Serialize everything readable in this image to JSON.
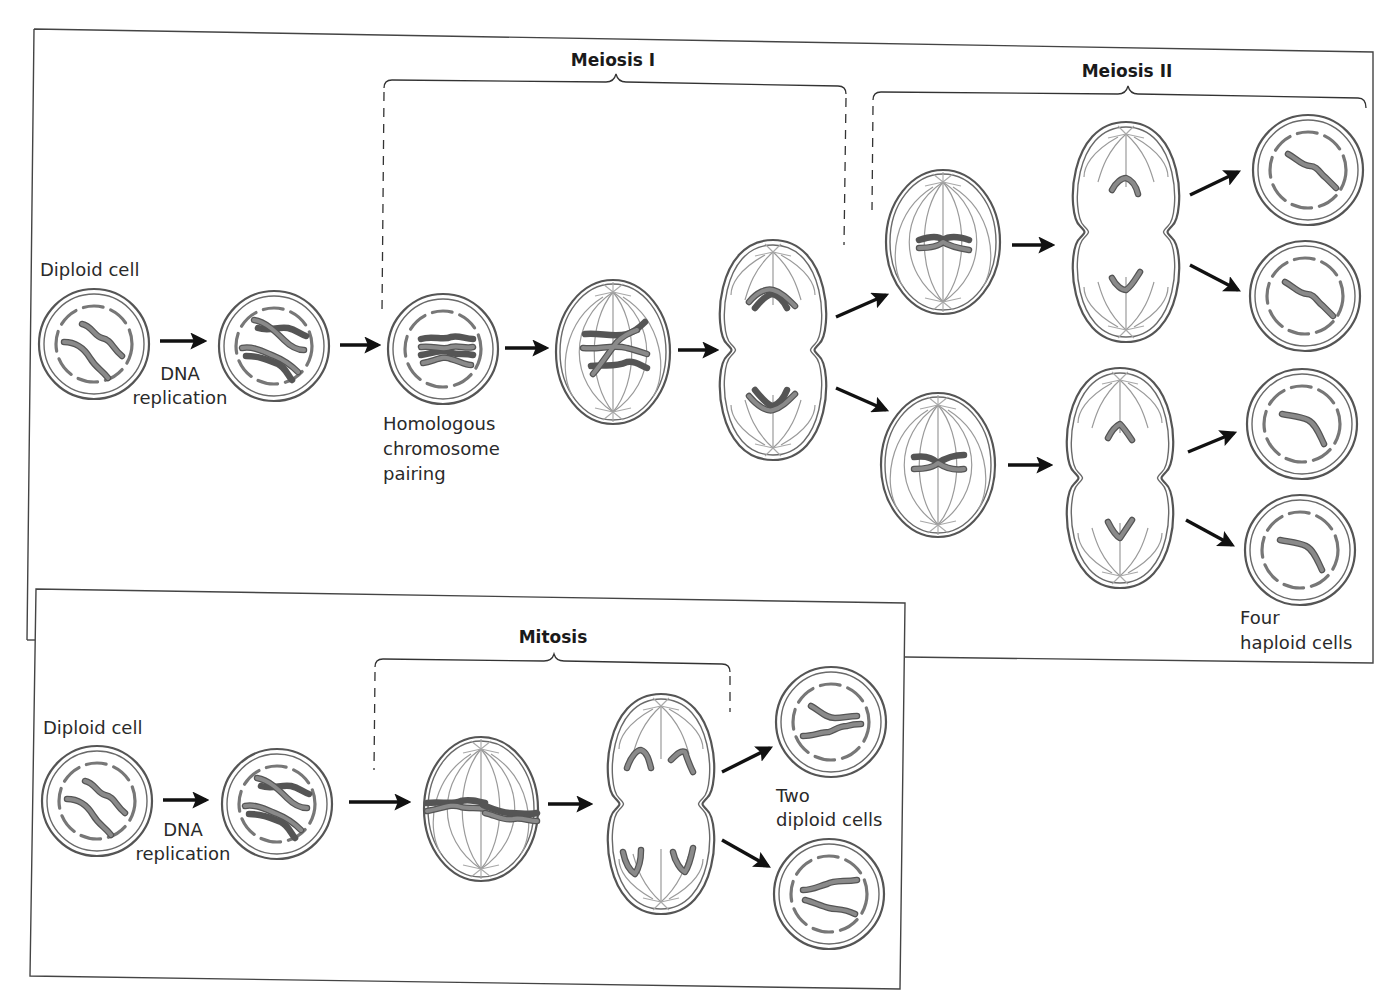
{
  "figure": {
    "meiosis_panel": {
      "phase_titles": {
        "meiosis_1": "Meiosis I",
        "meiosis_2": "Meiosis II"
      },
      "labels": {
        "start_cell": "Diploid cell",
        "dna_replication_line1": "DNA",
        "dna_replication_line2": "replication",
        "pairing_line1": "Homologous",
        "pairing_line2": "chromosome",
        "pairing_line3": "pairing",
        "result_line1": "Four",
        "result_line2": "haploid cells"
      },
      "stages": [
        "Diploid cell",
        "Replicated diploid cell",
        "Homologous chromosome pairing",
        "Metaphase I",
        "Anaphase/Telophase I",
        "Metaphase II (upper)",
        "Metaphase II (lower)",
        "Anaphase II (upper)",
        "Anaphase II (lower)",
        "Haploid cell 1",
        "Haploid cell 2",
        "Haploid cell 3",
        "Haploid cell 4"
      ]
    },
    "mitosis_panel": {
      "phase_titles": {
        "mitosis": "Mitosis"
      },
      "labels": {
        "start_cell": "Diploid cell",
        "dna_replication_line1": "DNA",
        "dna_replication_line2": "replication",
        "result_line1": "Two",
        "result_line2": "diploid cells"
      },
      "stages": [
        "Diploid cell",
        "Replicated diploid cell",
        "Metaphase",
        "Anaphase/Telophase",
        "Diploid daughter cell 1",
        "Diploid daughter cell 2"
      ]
    },
    "colors": {
      "cytoplasm_light": "#e6e6e6",
      "cytoplasm_dark": "#bdbdbd",
      "membrane": "#555555",
      "chromosome": "#6e6e6e",
      "arrow": "#111111"
    }
  }
}
